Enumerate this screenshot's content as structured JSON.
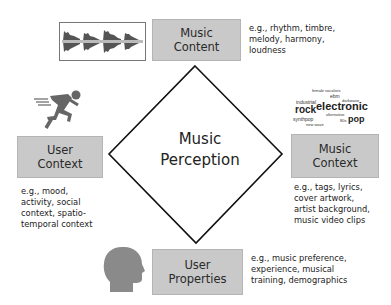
{
  "diagram": {
    "center": {
      "line1": "Music",
      "line2": "Perception"
    },
    "nodes": {
      "music_content": {
        "line1": "Music",
        "line2": "Content",
        "desc": [
          "e.g., rhythm, timbre,",
          "melody, harmony,",
          "loudness"
        ]
      },
      "user_context": {
        "line1": "User",
        "line2": "Context",
        "desc": [
          "e.g., mood,",
          "activity, social",
          "context, spatio-",
          "temporal context"
        ]
      },
      "music_context": {
        "line1": "Music",
        "line2": "Context",
        "desc": [
          "e.g., tags, lyrics,",
          "cover artwork,",
          "artist background,",
          "music video clips"
        ]
      },
      "user_properties": {
        "line1": "User",
        "line2": "Properties",
        "desc": [
          "e.g., music preference,",
          "experience, musical",
          "training, demographics"
        ]
      }
    },
    "icons": {
      "waveform": "audio-waveform-icon",
      "runner": "running-person-icon",
      "tag_cloud": "tag-cloud-icon",
      "head": "human-head-icon"
    },
    "tag_cloud_words": [
      "industrial",
      "rock",
      "electronic",
      "pop",
      "synthpop",
      "ebm",
      "alternative",
      "dance",
      "darkwave",
      "female vocalists",
      "new wave",
      "80s"
    ]
  }
}
